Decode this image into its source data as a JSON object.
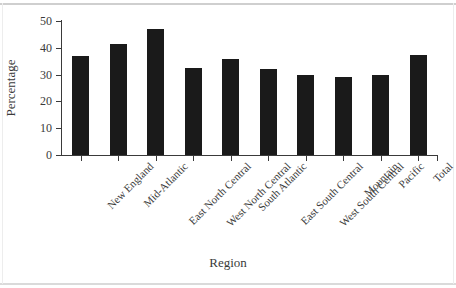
{
  "chart_data": {
    "type": "bar",
    "title": "",
    "xlabel": "Region",
    "ylabel": "Percentage",
    "categories": [
      "New England",
      "Mid-Atlantic",
      "East North Central",
      "West North Central",
      "South Atlantic",
      "East South Central",
      "West South Central",
      "Mountain",
      "Pacific",
      "Total"
    ],
    "values": [
      37,
      41.5,
      47,
      32.5,
      36,
      32,
      30,
      29,
      30,
      37.5
    ],
    "ylim": [
      0,
      50
    ],
    "yticks": [
      0,
      10,
      20,
      30,
      40,
      50
    ],
    "ytick_labels": [
      "0",
      "10",
      "20",
      "30",
      "40",
      "50"
    ],
    "grid": false,
    "legend": false,
    "bar_color": "#1a1a1a",
    "axis_color": "#3a3a3a"
  }
}
